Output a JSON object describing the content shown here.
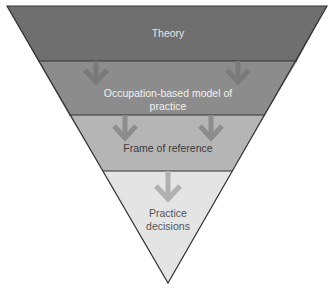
{
  "diagram": {
    "type": "inverted-pyramid",
    "levels": [
      {
        "label": "Theory",
        "color": "#6f6f6f",
        "text_color": "#e6e6e6"
      },
      {
        "label": "Occupation-based model of practice",
        "color": "#8c8c8c",
        "text_color": "#f0f0f0"
      },
      {
        "label": "Frame of reference",
        "color": "#b5b5b5",
        "text_color": "#3c3c3c"
      },
      {
        "label": "Practice decisions",
        "color": "#e4e4e4",
        "text_color": "#555555"
      }
    ],
    "arrows": [
      {
        "from": "Theory",
        "to": "Occupation-based model of practice",
        "count": 2,
        "color": "#7a7a7a"
      },
      {
        "from": "Occupation-based model of practice",
        "to": "Frame of reference",
        "count": 2,
        "color": "#8d8d8d"
      },
      {
        "from": "Frame of reference",
        "to": "Practice decisions",
        "count": 1,
        "color": "#b0b0b0"
      }
    ]
  }
}
